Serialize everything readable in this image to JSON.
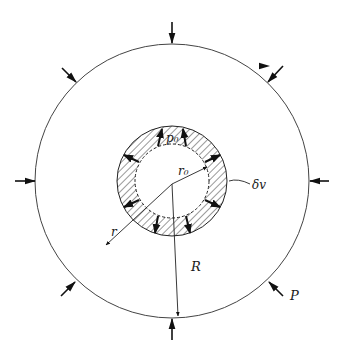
{
  "diagram": {
    "labels": {
      "inner_pressure": "p₀",
      "inner_radius": "r₀",
      "virtual_displacement": "δv",
      "radial_coordinate": "r",
      "outer_radius": "R",
      "external_load": "P"
    },
    "geometry": {
      "center": [
        172,
        181
      ],
      "outer_circle_radius": 137,
      "ring_outer_radius": 55,
      "ring_inner_radius": 37,
      "outer_arrow_count": 8
    },
    "colors": {
      "stroke": "#1a1a1a",
      "hatch": "#333333",
      "background": "#ffffff"
    }
  }
}
